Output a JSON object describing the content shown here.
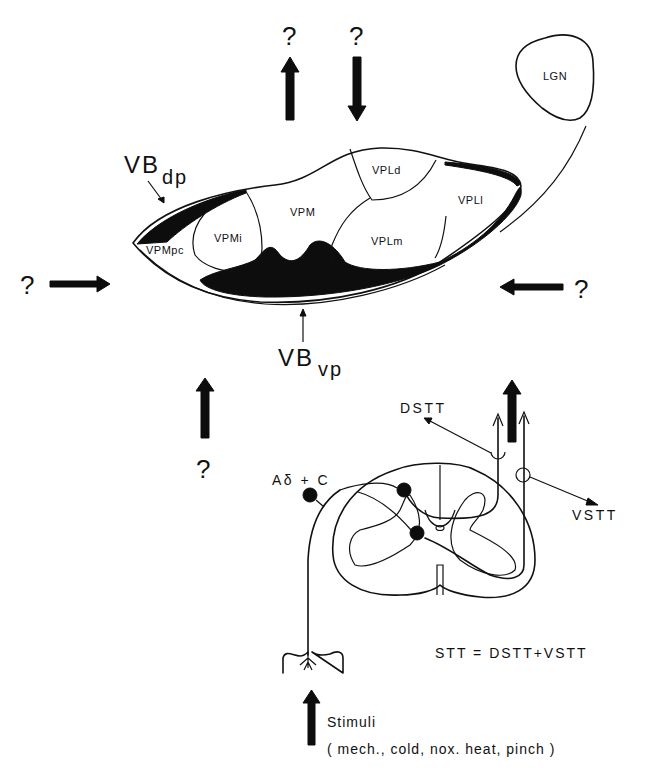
{
  "figure": {
    "unknown_mark": "?",
    "lgn_label": "LGN",
    "thalamus": {
      "vb_dp": {
        "main": "VB",
        "sub": "dp"
      },
      "vb_vp": {
        "main": "VB",
        "sub": "vp"
      },
      "nuclei": [
        "VPMpc",
        "VPMi",
        "VPM",
        "VPLd",
        "VPLm",
        "VPLl"
      ]
    },
    "spinal_cord": {
      "afferent_label": "Aδ + C",
      "dstt_label": "DSTT",
      "vstt_label": "VSTT",
      "equation": "STT = DSTT+VSTT"
    },
    "stimuli": {
      "label": "Stimuli",
      "types": "( mech., cold, nox. heat, pinch )"
    },
    "arrows": [
      {
        "id": "top-up",
        "direction": "up",
        "label": "?"
      },
      {
        "id": "top-down",
        "direction": "down",
        "label": "?"
      },
      {
        "id": "left-in",
        "direction": "right",
        "label": "?"
      },
      {
        "id": "right-in",
        "direction": "left",
        "label": "?"
      },
      {
        "id": "bottom-up",
        "direction": "up",
        "label": "?"
      },
      {
        "id": "stt-up",
        "direction": "up",
        "label": ""
      },
      {
        "id": "stimuli-up",
        "direction": "up",
        "label": ""
      }
    ],
    "colors": {
      "ink": "#111111",
      "fill": "#0d0d0d",
      "background": "#ffffff"
    }
  }
}
